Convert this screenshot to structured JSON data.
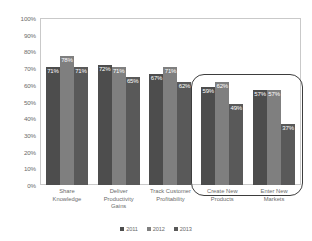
{
  "chart_data": {
    "type": "bar",
    "title": "",
    "xlabel": "",
    "ylabel": "",
    "ylim": [
      0,
      100
    ],
    "ytick_labels": [
      "100%",
      "90%",
      "80%",
      "70%",
      "60%",
      "50%",
      "40%",
      "30%",
      "20%",
      "10%",
      "0%"
    ],
    "ytick_values": [
      100,
      90,
      80,
      70,
      60,
      50,
      40,
      30,
      20,
      10,
      0
    ],
    "grid": false,
    "legend_position": "bottom",
    "categories": [
      "Share\nKnowledge",
      "Deliver\nProductivity\nGains",
      "Track Customer\nProfitability",
      "Create New\nProducts",
      "Enter New\nMarkets"
    ],
    "series": [
      {
        "name": "2011",
        "color": "#4d4d4d",
        "values": [
          71,
          72,
          67,
          59,
          57
        ],
        "labels": [
          "71%",
          "72%",
          "67%",
          "59%",
          "57%"
        ]
      },
      {
        "name": "2012",
        "color": "#7f7f7f",
        "values": [
          78,
          71,
          71,
          62,
          57
        ],
        "labels": [
          "78%",
          "71%",
          "71%",
          "62%",
          "57%"
        ]
      },
      {
        "name": "2013",
        "color": "#595959",
        "values": [
          71,
          65,
          62,
          49,
          37
        ],
        "labels": [
          "71%",
          "65%",
          "62%",
          "49%",
          "37%"
        ]
      }
    ],
    "annotations": [
      {
        "type": "rounded-rect-highlight",
        "covers": [
          "Create New Products",
          "Enter New Markets"
        ],
        "color": "#3d3d3d"
      }
    ]
  },
  "legend": {
    "items": [
      {
        "label": "2011",
        "color": "#4d4d4d"
      },
      {
        "label": "2012",
        "color": "#7f7f7f"
      },
      {
        "label": "2013",
        "color": "#595959"
      }
    ]
  }
}
